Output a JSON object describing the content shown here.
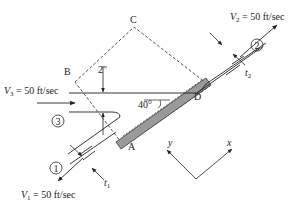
{
  "figure": {
    "type": "fluid-mechanics free-body diagram: 2-D jet striking inclined plate",
    "angle_label": "40°",
    "jet_thickness_label": "2\"",
    "points": {
      "A": "A",
      "B": "B",
      "C": "C",
      "D": "D"
    },
    "stations": {
      "s1": "1",
      "s2": "2",
      "s3": "3"
    },
    "velocities": {
      "v1": {
        "symbol": "V",
        "sub": "1",
        "value": " = 50 ft/sec"
      },
      "v2": {
        "symbol": "V",
        "sub": "2",
        "value": " = 50 ft/sec"
      },
      "v3": {
        "symbol": "V",
        "sub": "3",
        "value": " = 50 ft/sec"
      }
    },
    "thickness": {
      "t1": {
        "symbol": "t",
        "sub": "1"
      },
      "t2": {
        "symbol": "t",
        "sub": "2"
      }
    },
    "axes": {
      "x": "x",
      "y": "y"
    },
    "colors": {
      "line": "#222222",
      "plate_fill": "#9a9a9a",
      "background": "#ffffff"
    }
  }
}
